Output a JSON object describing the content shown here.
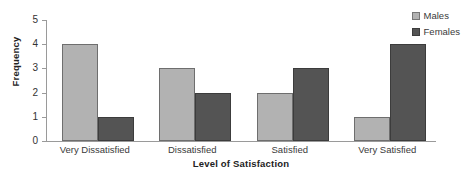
{
  "chart_data": {
    "type": "bar",
    "title": "",
    "subtitle": "",
    "xlabel": "Level of Satisfaction",
    "ylabel": "Frequency",
    "categories": [
      "Very Dissatisfied",
      "Dissatisfied",
      "Satisfied",
      "Very Satisfied"
    ],
    "series": [
      {
        "name": "Males",
        "values": [
          4,
          3,
          2,
          1
        ],
        "color": "#b2b2b2"
      },
      {
        "name": "Females",
        "values": [
          1,
          2,
          3,
          4
        ],
        "color": "#545454"
      }
    ],
    "ylim": [
      0,
      5
    ],
    "yticks": [
      "0",
      "1",
      "2",
      "3",
      "4",
      "5"
    ],
    "grid": false,
    "legend_position": "top-right",
    "annotations": []
  },
  "axes": {
    "y_title": "Frequency",
    "x_title": "Level of Satisfaction",
    "y_ticks": [
      {
        "label": "5",
        "value": 5
      },
      {
        "label": "4",
        "value": 4
      },
      {
        "label": "3",
        "value": 3
      },
      {
        "label": "2",
        "value": 2
      },
      {
        "label": "1",
        "value": 1
      },
      {
        "label": "0",
        "value": 0
      }
    ]
  },
  "categories": [
    {
      "label": "Very Dissatisfied",
      "males": 4,
      "females": 1
    },
    {
      "label": "Dissatisfied",
      "males": 3,
      "females": 2
    },
    {
      "label": "Satisfied",
      "males": 2,
      "females": 3
    },
    {
      "label": "Very Satisfied",
      "males": 1,
      "females": 4
    }
  ],
  "legend": {
    "items": [
      {
        "label": "Males",
        "swatch": "males-swatch"
      },
      {
        "label": "Females",
        "swatch": "females-swatch"
      }
    ]
  }
}
